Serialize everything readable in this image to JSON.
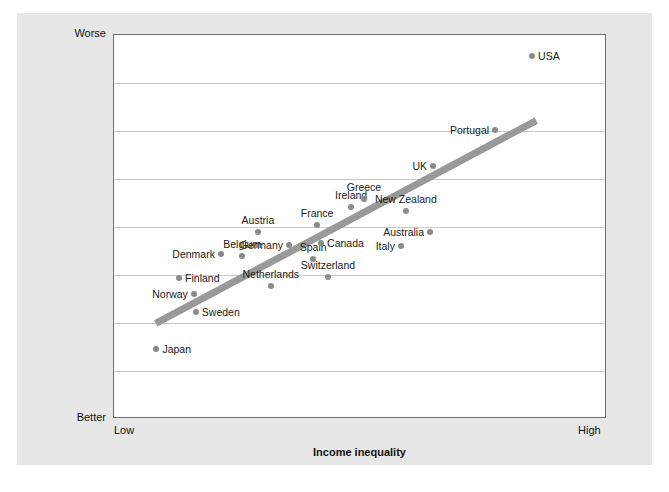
{
  "chart_data": {
    "type": "scatter",
    "title": "",
    "xlabel": "Income inequality",
    "ylabel": "Index of health and social problems",
    "x_tick_labels": [
      "Low",
      "High"
    ],
    "y_tick_labels": [
      "Worse",
      "Better"
    ],
    "xlim": [
      0,
      100
    ],
    "ylim": [
      0,
      100
    ],
    "grid": "horizontal",
    "legend": "none",
    "y_axis_direction": "Worse at top, Better at bottom",
    "gridline_count": 7,
    "point_color": "#8a8a8a",
    "trend_color": "#999999",
    "plot_bg": "#ffffff",
    "page_bg": "#e7e7e7",
    "points": [
      {
        "label": "Japan",
        "x": 8.6,
        "y": 18.2,
        "label_side": "right"
      },
      {
        "label": "Norway",
        "x": 16.2,
        "y": 32.6,
        "label_side": "left"
      },
      {
        "label": "Sweden",
        "x": 16.6,
        "y": 27.9,
        "label_side": "right"
      },
      {
        "label": "Finland",
        "x": 13.2,
        "y": 36.7,
        "label_side": "right"
      },
      {
        "label": "Denmark",
        "x": 21.7,
        "y": 42.9,
        "label_side": "left"
      },
      {
        "label": "Belgium",
        "x": 26.0,
        "y": 42.4,
        "label_side": "above"
      },
      {
        "label": "Netherlands",
        "x": 31.8,
        "y": 34.6,
        "label_side": "above"
      },
      {
        "label": "Germany",
        "x": 35.5,
        "y": 45.3,
        "label_side": "left"
      },
      {
        "label": "Austria",
        "x": 29.2,
        "y": 48.7,
        "label_side": "above"
      },
      {
        "label": "Switzerland",
        "x": 43.4,
        "y": 36.9,
        "label_side": "above"
      },
      {
        "label": "Spain",
        "x": 40.4,
        "y": 41.6,
        "label_side": "above"
      },
      {
        "label": "Canada",
        "x": 42.0,
        "y": 45.8,
        "label_side": "right"
      },
      {
        "label": "France",
        "x": 41.2,
        "y": 50.5,
        "label_side": "above"
      },
      {
        "label": "Ireland",
        "x": 48.1,
        "y": 55.2,
        "label_side": "above"
      },
      {
        "label": "Greece",
        "x": 50.7,
        "y": 57.3,
        "label_side": "above"
      },
      {
        "label": "Italy",
        "x": 58.2,
        "y": 45.1,
        "label_side": "left"
      },
      {
        "label": "Australia",
        "x": 64.1,
        "y": 48.7,
        "label_side": "left"
      },
      {
        "label": "New Zealand",
        "x": 59.2,
        "y": 54.2,
        "label_side": "above"
      },
      {
        "label": "UK",
        "x": 64.7,
        "y": 66.0,
        "label_side": "left"
      },
      {
        "label": "Portugal",
        "x": 77.3,
        "y": 75.3,
        "label_side": "left"
      },
      {
        "label": "USA",
        "x": 84.8,
        "y": 94.6,
        "label_side": "right"
      }
    ],
    "trend_line": {
      "x0": 8.5,
      "y0": 24.5,
      "x1": 86.0,
      "y1": 77.6
    }
  }
}
